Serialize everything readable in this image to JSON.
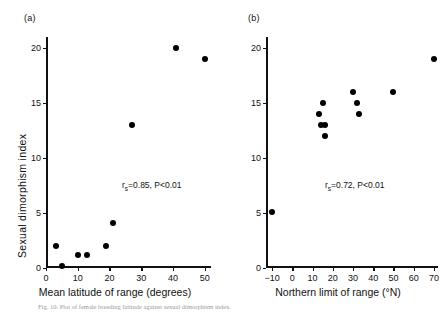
{
  "figure": {
    "caption": "Fig. 10. Plot of female breeding latitude against sexual dimorphism index."
  },
  "chart_data": [
    {
      "type": "scatter",
      "panel_label": "(a)",
      "title": "",
      "xlabel": "Mean latitude of range (degrees)",
      "ylabel": "Sexual dimorphism index",
      "xlim": [
        0,
        52
      ],
      "ylim": [
        0,
        21
      ],
      "xticks": [
        0,
        10,
        20,
        30,
        40,
        50
      ],
      "xticklabels": [
        "0",
        "10",
        "20",
        "30",
        "40",
        "50"
      ],
      "yticks": [
        0,
        5,
        10,
        15,
        20
      ],
      "yticklabels": [
        "0",
        "5",
        "10",
        "15",
        "20"
      ],
      "grid": false,
      "legend": "none",
      "marker": "filled-circle",
      "marker_color": "#000000",
      "annotation": "r_s=0.85, P<0.01",
      "annotation_r": "r",
      "annotation_sub": "s",
      "annotation_rest": "=0.85, P<0.01",
      "x": [
        3,
        5,
        10,
        13,
        19,
        21,
        27,
        41,
        50
      ],
      "y": [
        2.0,
        0.2,
        1.2,
        1.2,
        2.0,
        4.1,
        13.0,
        20.0,
        19.0
      ]
    },
    {
      "type": "scatter",
      "panel_label": "(b)",
      "title": "",
      "xlabel": "Northern limit of range (°N)",
      "ylabel": "Sexual dimorphism index",
      "xlim": [
        -13,
        72
      ],
      "ylim": [
        0,
        21
      ],
      "xticks": [
        -10,
        0,
        10,
        20,
        30,
        40,
        50,
        60,
        70
      ],
      "xticklabels": [
        "−10",
        "0",
        "10",
        "20",
        "30",
        "40",
        "50",
        "60",
        "70"
      ],
      "yticks": [
        0,
        5,
        10,
        15,
        20
      ],
      "yticklabels": [
        "0",
        "5",
        "10",
        "15",
        "20"
      ],
      "grid": false,
      "legend": "none",
      "marker": "filled-circle",
      "marker_color": "#000000",
      "annotation": "r_s=0.72, P<0.01",
      "annotation_r": "r",
      "annotation_sub": "s",
      "annotation_rest": "=0.72, P<0.01",
      "x": [
        -10,
        13,
        14,
        15,
        16,
        16,
        30,
        32,
        33,
        50,
        70
      ],
      "y": [
        5.1,
        14.0,
        13.0,
        15.0,
        13.0,
        12.0,
        16.0,
        15.0,
        14.0,
        16.0,
        19.0
      ]
    }
  ]
}
